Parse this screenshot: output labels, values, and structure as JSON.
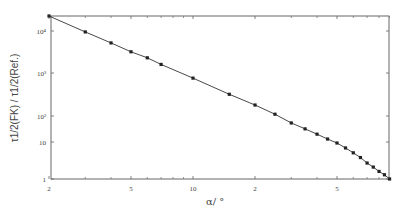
{
  "chart_data": {
    "type": "line",
    "title": "",
    "xlabel": "α / °",
    "ylabel": "τ1/2(FK) / τ1/2(Ref.)",
    "xscale": "log",
    "yscale": "log",
    "xlim": [
      2,
      90
    ],
    "ylim": [
      1,
      22000
    ],
    "grid": false,
    "legend": null,
    "x_tick_labels": [
      "2",
      "5",
      "10",
      "2",
      "5"
    ],
    "x_tick_values": [
      2,
      5,
      10,
      20,
      50
    ],
    "y_tick_labels": [
      "1",
      "10",
      "10²",
      "10³",
      "10⁴"
    ],
    "y_tick_values": [
      1,
      10,
      100,
      1000,
      10000
    ],
    "series": [
      {
        "name": "τ1/2 ratio",
        "marker": "square",
        "line": "solid",
        "color": "#333333",
        "x": [
          2,
          3,
          4,
          5,
          6,
          7,
          10,
          15,
          20,
          25,
          30,
          35,
          40,
          45,
          50,
          55,
          60,
          65,
          70,
          75,
          80,
          85,
          90
        ],
        "y": [
          22000,
          9500,
          5200,
          3200,
          2300,
          1600,
          760,
          320,
          180,
          110,
          54,
          32,
          20,
          13,
          9.4,
          6.9,
          5.1,
          3.8,
          2.7,
          2.1,
          1.6,
          1.3,
          1.0
        ]
      }
    ]
  },
  "labels": {
    "xlabel_text": "α/ °",
    "ylabel_text": "τ1/2(FK) / τ1/2(Ref.)"
  }
}
